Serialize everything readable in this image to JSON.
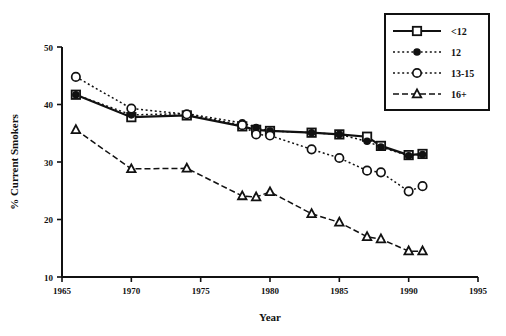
{
  "chart_data": {
    "type": "line",
    "title": "",
    "xlabel": "Year",
    "ylabel": "% Current Smokers",
    "xlim": [
      1965,
      1995
    ],
    "ylim": [
      10,
      50
    ],
    "xticks": [
      1965,
      1970,
      1975,
      1980,
      1985,
      1990,
      1995
    ],
    "yticks": [
      10,
      20,
      30,
      40,
      50
    ],
    "grid": false,
    "legend_position": "top-right",
    "series": [
      {
        "name": "<12",
        "marker": "square-open",
        "line": "solid",
        "x": [
          1966,
          1970,
          1974,
          1978,
          1979,
          1980,
          1983,
          1985,
          1987,
          1988,
          1990,
          1991
        ],
        "values": [
          41.7,
          37.8,
          38.1,
          36.2,
          35.6,
          35.4,
          35.1,
          34.8,
          34.4,
          32.8,
          31.2,
          31.4
        ]
      },
      {
        "name": "12",
        "marker": "circle-filled",
        "line": "dotted",
        "x": [
          1966,
          1970,
          1974,
          1978,
          1979,
          1980,
          1983,
          1985,
          1987,
          1988,
          1990,
          1991
        ],
        "values": [
          41.7,
          38.2,
          38.4,
          36.8,
          36.0,
          35.4,
          35.1,
          34.8,
          33.6,
          32.6,
          31.1,
          31.3
        ]
      },
      {
        "name": "13-15",
        "marker": "circle-open",
        "line": "dotted",
        "x": [
          1966,
          1970,
          1974,
          1978,
          1979,
          1980,
          1983,
          1985,
          1987,
          1988,
          1990,
          1991
        ],
        "values": [
          44.8,
          39.3,
          38.3,
          36.4,
          34.8,
          34.6,
          32.2,
          30.7,
          28.5,
          28.2,
          24.9,
          25.8
        ]
      },
      {
        "name": "16+",
        "marker": "triangle-open",
        "line": "dashed",
        "x": [
          1966,
          1970,
          1974,
          1978,
          1979,
          1980,
          1983,
          1985,
          1987,
          1988,
          1990,
          1991
        ],
        "values": [
          35.6,
          28.8,
          28.9,
          24.1,
          23.9,
          24.8,
          21.0,
          19.5,
          17.0,
          16.6,
          14.5,
          14.5
        ]
      }
    ]
  },
  "legend": {
    "entries": [
      {
        "label": "<12"
      },
      {
        "label": "12"
      },
      {
        "label": "13-15"
      },
      {
        "label": "16+"
      }
    ]
  },
  "axes": {
    "x_title": "Year",
    "y_title": "% Current Smokers",
    "x_tick_labels": [
      "1965",
      "1970",
      "1975",
      "1980",
      "1985",
      "1990",
      "1995"
    ],
    "y_tick_labels": [
      "10",
      "20",
      "30",
      "40",
      "50"
    ]
  }
}
